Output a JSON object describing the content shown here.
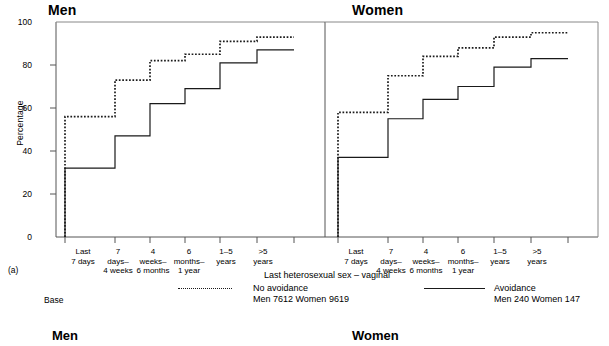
{
  "figure": {
    "panel_a_marker": "(a)",
    "base_label": "Base",
    "panels": [
      {
        "key": "men",
        "title": "Men"
      },
      {
        "key": "women",
        "title": "Women"
      }
    ],
    "bottom_titles": {
      "men": "Men",
      "women": "Women"
    }
  },
  "legend": {
    "title": "Last heterosexual sex – vaginal",
    "entries": [
      {
        "name": "no-avoidance",
        "label": "No avoidance",
        "base": "Men  7612  Women  9619",
        "style": "dotted",
        "color": "#1a1a1a"
      },
      {
        "name": "avoidance",
        "label": "Avoidance",
        "base": "Men  240  Women  147",
        "style": "solid",
        "color": "#1a1a1a"
      }
    ]
  },
  "chart_data": {
    "type": "line",
    "title": "",
    "xlabel": "",
    "ylabel": "Percentage",
    "ylim": [
      0,
      100
    ],
    "yticks": [
      0,
      20,
      40,
      60,
      80,
      100
    ],
    "ytick_labels": [
      "0",
      "20",
      "40",
      "60",
      "80",
      "100"
    ],
    "grid": false,
    "legend_position": "below",
    "step_plot": true,
    "categories": [
      "Last\n7 days",
      "7\ndays–\n4 weeks",
      "4\nweeks–\n6 months",
      "6\nmonths–\n1 year",
      "1–5\nyears",
      ">5\nyears"
    ],
    "category_lines": [
      [
        "Last",
        "7 days",
        ""
      ],
      [
        "7",
        "days–",
        "4 weeks"
      ],
      [
        "4",
        "weeks–",
        "6 months"
      ],
      [
        "6",
        "months–",
        "1 year"
      ],
      [
        "1–5",
        "years",
        ""
      ],
      [
        ">5",
        "years",
        ""
      ]
    ],
    "panels": [
      {
        "name": "Men",
        "series": [
          {
            "name": "No avoidance",
            "style": "dotted",
            "values": [
              56,
              73,
              82,
              85,
              91,
              93
            ]
          },
          {
            "name": "Avoidance",
            "style": "solid",
            "values": [
              32,
              47,
              62,
              69,
              81,
              87
            ]
          }
        ]
      },
      {
        "name": "Women",
        "series": [
          {
            "name": "No avoidance",
            "style": "dotted",
            "values": [
              58,
              75,
              84,
              88,
              93,
              95
            ]
          },
          {
            "name": "Avoidance",
            "style": "solid",
            "values": [
              37,
              55,
              64,
              70,
              79,
              83
            ]
          }
        ]
      }
    ]
  }
}
